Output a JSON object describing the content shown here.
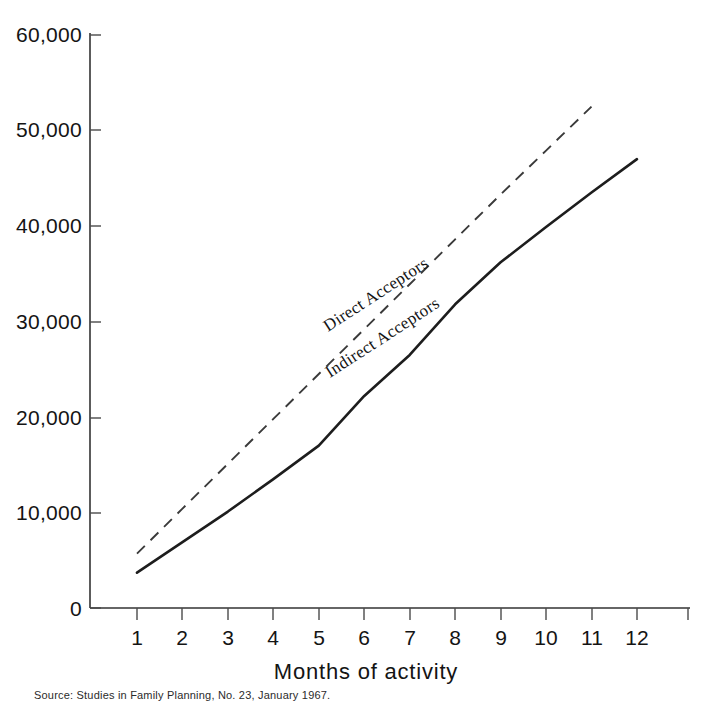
{
  "chart_data": {
    "type": "line",
    "title": "",
    "subtitle": "",
    "xlabel": "Months of activity",
    "ylabel": "",
    "xlim": [
      0,
      12.6
    ],
    "ylim": [
      0,
      60000
    ],
    "grid": false,
    "legend_position": "inline-along-curves",
    "x_tick_labels": [
      "1",
      "2",
      "3",
      "4",
      "5",
      "6",
      "7",
      "8",
      "9",
      "10",
      "11",
      "12"
    ],
    "x": [
      1,
      2,
      3,
      4,
      5,
      6,
      7,
      8,
      9,
      10,
      11,
      12
    ],
    "y_tick_labels": [
      "0",
      "10,000",
      "20,000",
      "30,000",
      "40,000",
      "50,000",
      "60,000"
    ],
    "y_ticks": [
      0,
      10000,
      20000,
      30000,
      40000,
      50000,
      60000
    ],
    "series": [
      {
        "name": "Direct Acceptors",
        "style": "dashed",
        "color": "#3a3a3a",
        "x": [
          1,
          2,
          3,
          4,
          5,
          6,
          7,
          8,
          9,
          10,
          11
        ],
        "values": [
          5700,
          10400,
          15100,
          19800,
          24500,
          29200,
          33900,
          38600,
          43300,
          47900,
          52500
        ]
      },
      {
        "name": "Indirect Acceptors",
        "style": "solid",
        "color": "#1d1d1d",
        "x": [
          1,
          2,
          3,
          4,
          5,
          6,
          7,
          8,
          9,
          10,
          11,
          12
        ],
        "values": [
          3700,
          6900,
          10100,
          13500,
          17000,
          22200,
          26500,
          31800,
          36200,
          39900,
          43500,
          47000
        ]
      }
    ],
    "annotations": [
      {
        "text": "Direct Acceptors",
        "series": "Direct Acceptors",
        "rotation": -33
      },
      {
        "text": "Indirect Acceptors",
        "series": "Indirect Acceptors",
        "rotation": -33
      }
    ]
  },
  "caption": {
    "text": "Source: Studies in Family Planning, No. 23, January 1967."
  }
}
